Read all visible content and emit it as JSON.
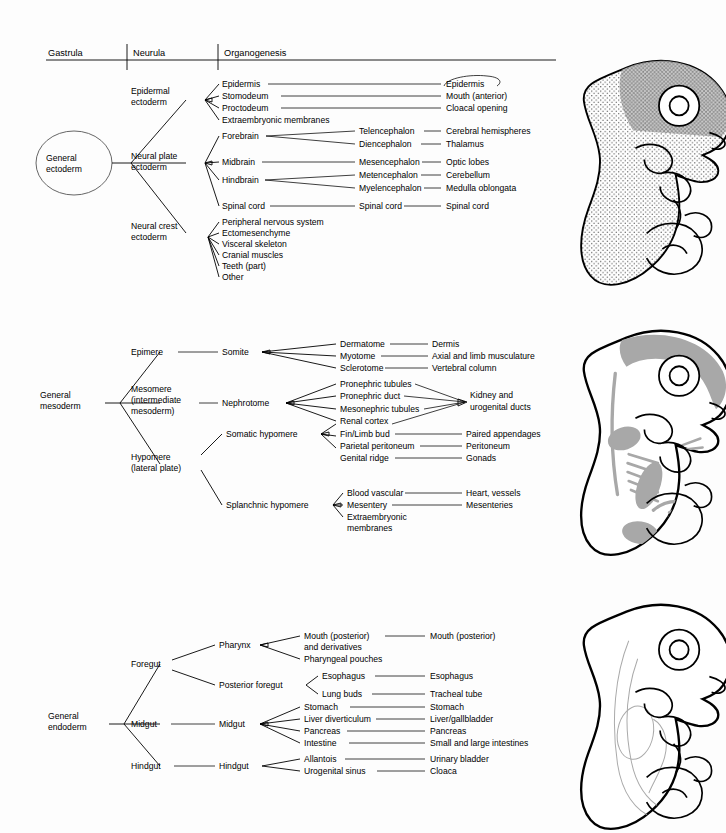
{
  "header": {
    "columns": [
      "Gastrula",
      "Neurula",
      "Organogenesis"
    ]
  },
  "sections": [
    {
      "id": "ectoderm",
      "root": "General\nectoderm",
      "root_line1": "General",
      "root_line2": "ectoderm",
      "branches": [
        {
          "label_line1": "Epidermal",
          "label_line2": "ectoderm",
          "leaves": [
            {
              "l2": "Epidermis",
              "l3": "",
              "l4": "Epidermis"
            },
            {
              "l2": "Stomodeum",
              "l3": "",
              "l4": "Mouth (anterior)"
            },
            {
              "l2": "Proctodeum",
              "l3": "",
              "l4": "Cloacal opening"
            },
            {
              "l2": "Extraembryonic membranes",
              "l3": "",
              "l4": ""
            }
          ]
        },
        {
          "label_line1": "Neural plate",
          "label_line2": "ectoderm",
          "leaves": [
            {
              "l2": "Forebrain",
              "l3": "Telencephalon",
              "l4": "Cerebral hemispheres"
            },
            {
              "l2": "",
              "l3": "Diencephalon",
              "l4": "Thalamus"
            },
            {
              "l2": "Midbrain",
              "l3": "Mesencephalon",
              "l4": "Optic lobes"
            },
            {
              "l2": "Hindbrain",
              "l3": "Metencephalon",
              "l4": "Cerebellum"
            },
            {
              "l2": "",
              "l3": "Myelencephalon",
              "l4": "Medulla oblongata"
            },
            {
              "l2": "Spinal cord",
              "l3": "Spinal cord",
              "l4": "Spinal cord"
            }
          ]
        },
        {
          "label_line1": "Neural crest",
          "label_line2": "ectoderm",
          "leaves": [
            {
              "l2": "Peripheral nervous system",
              "l3": "",
              "l4": ""
            },
            {
              "l2": "Ectomesenchyme",
              "l3": "",
              "l4": ""
            },
            {
              "l2": "Visceral skeleton",
              "l3": "",
              "l4": ""
            },
            {
              "l2": "Cranial muscles",
              "l3": "",
              "l4": ""
            },
            {
              "l2": "Teeth (part)",
              "l3": "",
              "l4": ""
            },
            {
              "l2": "Other",
              "l3": "",
              "l4": ""
            }
          ]
        }
      ]
    },
    {
      "id": "mesoderm",
      "root_line1": "General",
      "root_line2": "mesoderm",
      "branches": [
        {
          "label_line1": "Epimere",
          "label_line2": "",
          "mid": "Somite",
          "leaves": [
            {
              "l3": "Dermatome",
              "l4": "Dermis"
            },
            {
              "l3": "Myotome",
              "l4": "Axial and limb musculature"
            },
            {
              "l3": "Sclerotome",
              "l4": "Vertebral column"
            }
          ]
        },
        {
          "label_line1": "Mesomere",
          "label_line2": "(intermediate",
          "label_line3": "mesoderm)",
          "mid": "Nephrotome",
          "converge_line1": "Kidney and",
          "converge_line2": "urogenital ducts",
          "leaves": [
            {
              "l3": "Pronephric tubules",
              "l4": ""
            },
            {
              "l3": "Pronephric duct",
              "l4": ""
            },
            {
              "l3": "Mesonephric tubules",
              "l4": ""
            },
            {
              "l3": "Renal cortex",
              "l4": ""
            }
          ]
        },
        {
          "label_line1": "Hypomere",
          "label_line2": "(lateral plate)",
          "mid": "Somatic hypomere",
          "leaves": [
            {
              "l3": "Fin/Limb bud",
              "l4": "Paired appendages"
            },
            {
              "l3": "Parietal peritoneum",
              "l4": "Peritoneum"
            },
            {
              "l3": "Genital ridge",
              "l4": "Gonads"
            }
          ]
        },
        {
          "label_line1": "",
          "mid": "Splanchnic hypomere",
          "leaves": [
            {
              "l3": "Blood vascular",
              "l4": "Heart, vessels"
            },
            {
              "l3": "Mesentery",
              "l4": "Mesenteries"
            },
            {
              "l3": "Extraembryonic",
              "l4": ""
            },
            {
              "l3": "membranes",
              "l4": ""
            }
          ]
        }
      ]
    },
    {
      "id": "endoderm",
      "root_line1": "General",
      "root_line2": "endoderm",
      "branches": [
        {
          "label_line1": "Foregut",
          "mid": "Pharynx",
          "leaves": [
            {
              "l3": "Mouth (posterior)",
              "l4": "Mouth (posterior)"
            },
            {
              "l3": "and derivatives",
              "l4": ""
            },
            {
              "l3": "Pharyngeal pouches",
              "l4": ""
            }
          ]
        },
        {
          "label_line1": "",
          "mid": "Posterior foregut",
          "leaves": [
            {
              "l3": "Esophagus",
              "l4": "Esophagus"
            },
            {
              "l3": "Lung buds",
              "l4": "Tracheal tube"
            }
          ]
        },
        {
          "label_line1": "Midgut",
          "mid": "Midgut",
          "leaves": [
            {
              "l3": "Stomach",
              "l4": "Stomach"
            },
            {
              "l3": "Liver diverticulum",
              "l4": "Liver/gallbladder"
            },
            {
              "l3": "Pancreas",
              "l4": "Pancreas"
            },
            {
              "l3": "Intestine",
              "l4": "Small and large intestines"
            }
          ]
        },
        {
          "label_line1": "Hindgut",
          "mid": "Hindgut",
          "leaves": [
            {
              "l3": "Allantois",
              "l4": "Urinary bladder"
            },
            {
              "l3": "Urogenital sinus",
              "l4": "Cloaca"
            }
          ]
        }
      ]
    }
  ],
  "figures": [
    {
      "name": "embryo-ectoderm",
      "shading": "stippled",
      "accent": "#a8a8a8"
    },
    {
      "name": "embryo-mesoderm",
      "shading": "gray-fill",
      "accent": "#a8a8a8"
    },
    {
      "name": "embryo-endoderm",
      "shading": "outline",
      "accent": "#aaaaaa"
    }
  ]
}
